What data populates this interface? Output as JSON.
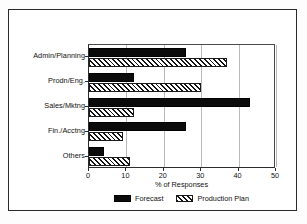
{
  "chart_data": {
    "type": "bar",
    "orientation": "horizontal",
    "title": "",
    "xlabel": "% of Responses",
    "ylabel": "",
    "xlim": [
      0,
      50
    ],
    "xticks": [
      0,
      10,
      20,
      30,
      40,
      50
    ],
    "grid": true,
    "legend_position": "bottom",
    "categories": [
      "Admin/Planning",
      "Prodn/Eng.",
      "Sales/Mktng",
      "Fin./Acctng",
      "Others"
    ],
    "series": [
      {
        "name": "Forecast",
        "values": [
          26,
          12,
          43,
          26,
          4
        ],
        "color": "#0b0b0b",
        "fill": "solid"
      },
      {
        "name": "Production Plan",
        "values": [
          37,
          30,
          12,
          9,
          11
        ],
        "color": "#141414",
        "fill": "diagonal-hatch"
      }
    ]
  },
  "legend": {
    "items": [
      {
        "label": "Forecast",
        "swatch": "solid-black-swatch"
      },
      {
        "label": "Production Plan",
        "swatch": "hatched-swatch"
      }
    ]
  }
}
